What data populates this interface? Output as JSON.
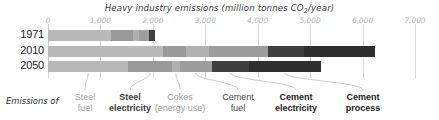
{
  "chart_data": {
    "type": "bar",
    "orientation": "horizontal",
    "stacked": true,
    "title": "Heavy industry emissions (million tonnes CO2/year)",
    "title_prefix": "Heavy industry emissions (million tonnes CO",
    "title_sub": "2",
    "title_suffix": "/year)",
    "xlabel": "",
    "ylabel": "",
    "xlim": [
      0,
      7000
    ],
    "grid": true,
    "legend_position": "bottom",
    "legend_prefix": "Emissions of",
    "tick_labels": [
      "0",
      "1,000",
      "2,000",
      "3,000",
      "4,000",
      "5,000",
      "6,000",
      "7,000"
    ],
    "tick_values": [
      0,
      1000,
      2000,
      3000,
      4000,
      5000,
      6000,
      7000
    ],
    "categories": [
      "1971",
      "2010",
      "2050"
    ],
    "series": [
      {
        "name": "Steel fuel",
        "label_line1": "Steel",
        "label_line2": "fuel",
        "color": "#b9b9b9",
        "label_color": "#a8a8a8",
        "bold": false,
        "values": [
          1200,
          2200,
          1530
        ]
      },
      {
        "name": "Steel electricity",
        "label_line1": "Steel",
        "label_line2": "electricity",
        "color": "#9a9a9a",
        "label_color": "#3a3a3a",
        "bold": true,
        "values": [
          430,
          430,
          840
        ]
      },
      {
        "name": "Cokes (energy use)",
        "label_line1": "Cokes",
        "label_line2": "(energy use)",
        "color": "#b0b0b0",
        "label_color": "#a0a0a0",
        "bold": false,
        "values": [
          110,
          440,
          140
        ]
      },
      {
        "name": "Cement fuel",
        "label_line1": "Cement",
        "label_line2": "fuel",
        "color": "#9d9d9d",
        "label_color": "#4a4a4a",
        "bold": false,
        "values": [
          180,
          1120,
          620
        ]
      },
      {
        "name": "Cement electricity",
        "label_line1": "Cement",
        "label_line2": "electricity",
        "color": "#3f3f3f",
        "label_color": "#1c1c1c",
        "bold": true,
        "values": [
          120,
          700,
          700
        ]
      },
      {
        "name": "Cement process",
        "label_line1": "Cement",
        "label_line2": "process",
        "color": "#2e2e2e",
        "label_color": "#1c1c1c",
        "bold": true,
        "values": [
          0,
          1350,
          1370
        ]
      }
    ],
    "row_totals": [
      2040,
      6240,
      5200
    ]
  }
}
